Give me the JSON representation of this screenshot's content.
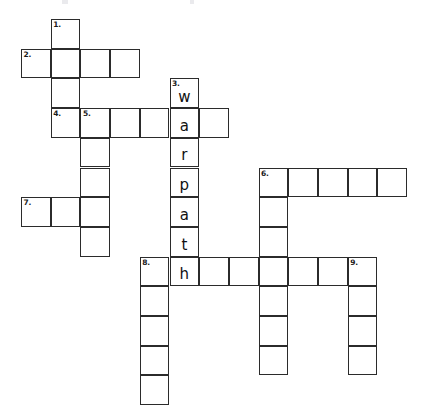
{
  "puzzle": {
    "title": "Crossword Puzzle",
    "grid": {
      "origin_x": 21,
      "origin_y": 19,
      "cell_size": 29.7,
      "columns": 13,
      "rows": 13,
      "line_color": "#2b2b2b",
      "cell_fill": "#ffffff",
      "background": "#ffffff"
    },
    "numbers": [
      {
        "label": "1.",
        "col": 1,
        "row": 0
      },
      {
        "label": "2.",
        "col": 0,
        "row": 1
      },
      {
        "label": "3.",
        "col": 5,
        "row": 2
      },
      {
        "label": "4.",
        "col": 1,
        "row": 3
      },
      {
        "label": "5.",
        "col": 2,
        "row": 3
      },
      {
        "label": "6.",
        "col": 8,
        "row": 5
      },
      {
        "label": "7.",
        "col": 0,
        "row": 6
      },
      {
        "label": "8.",
        "col": 4,
        "row": 8
      },
      {
        "label": "9.",
        "col": 11,
        "row": 8
      }
    ],
    "filled_answer": {
      "clue_number": "3.",
      "direction": "down",
      "word": "warpath",
      "start_col": 5,
      "start_row": 2,
      "letters": [
        "w",
        "a",
        "r",
        "p",
        "a",
        "t",
        "h"
      ]
    },
    "cells": [
      {
        "col": 1,
        "row": 0,
        "num": "1.",
        "letter": ""
      },
      {
        "col": 0,
        "row": 1,
        "num": "2.",
        "letter": ""
      },
      {
        "col": 1,
        "row": 1,
        "num": "",
        "letter": ""
      },
      {
        "col": 2,
        "row": 1,
        "num": "",
        "letter": ""
      },
      {
        "col": 3,
        "row": 1,
        "num": "",
        "letter": ""
      },
      {
        "col": 1,
        "row": 2,
        "num": "",
        "letter": ""
      },
      {
        "col": 5,
        "row": 2,
        "num": "3.",
        "letter": "w"
      },
      {
        "col": 1,
        "row": 3,
        "num": "4.",
        "letter": ""
      },
      {
        "col": 2,
        "row": 3,
        "num": "5.",
        "letter": ""
      },
      {
        "col": 3,
        "row": 3,
        "num": "",
        "letter": ""
      },
      {
        "col": 4,
        "row": 3,
        "num": "",
        "letter": ""
      },
      {
        "col": 5,
        "row": 3,
        "num": "",
        "letter": "a"
      },
      {
        "col": 6,
        "row": 3,
        "num": "",
        "letter": ""
      },
      {
        "col": 2,
        "row": 4,
        "num": "",
        "letter": ""
      },
      {
        "col": 5,
        "row": 4,
        "num": "",
        "letter": "r"
      },
      {
        "col": 2,
        "row": 5,
        "num": "",
        "letter": ""
      },
      {
        "col": 5,
        "row": 5,
        "num": "",
        "letter": "p"
      },
      {
        "col": 8,
        "row": 5,
        "num": "6.",
        "letter": ""
      },
      {
        "col": 9,
        "row": 5,
        "num": "",
        "letter": ""
      },
      {
        "col": 10,
        "row": 5,
        "num": "",
        "letter": ""
      },
      {
        "col": 11,
        "row": 5,
        "num": "",
        "letter": ""
      },
      {
        "col": 12,
        "row": 5,
        "num": "",
        "letter": ""
      },
      {
        "col": 0,
        "row": 6,
        "num": "7.",
        "letter": ""
      },
      {
        "col": 1,
        "row": 6,
        "num": "",
        "letter": ""
      },
      {
        "col": 2,
        "row": 6,
        "num": "",
        "letter": ""
      },
      {
        "col": 5,
        "row": 6,
        "num": "",
        "letter": "a"
      },
      {
        "col": 8,
        "row": 6,
        "num": "",
        "letter": ""
      },
      {
        "col": 2,
        "row": 7,
        "num": "",
        "letter": ""
      },
      {
        "col": 5,
        "row": 7,
        "num": "",
        "letter": "t"
      },
      {
        "col": 8,
        "row": 7,
        "num": "",
        "letter": ""
      },
      {
        "col": 4,
        "row": 8,
        "num": "8.",
        "letter": ""
      },
      {
        "col": 5,
        "row": 8,
        "num": "",
        "letter": "h"
      },
      {
        "col": 6,
        "row": 8,
        "num": "",
        "letter": ""
      },
      {
        "col": 7,
        "row": 8,
        "num": "",
        "letter": ""
      },
      {
        "col": 8,
        "row": 8,
        "num": "",
        "letter": ""
      },
      {
        "col": 9,
        "row": 8,
        "num": "",
        "letter": ""
      },
      {
        "col": 10,
        "row": 8,
        "num": "",
        "letter": ""
      },
      {
        "col": 11,
        "row": 8,
        "num": "9.",
        "letter": ""
      },
      {
        "col": 4,
        "row": 9,
        "num": "",
        "letter": ""
      },
      {
        "col": 8,
        "row": 9,
        "num": "",
        "letter": ""
      },
      {
        "col": 11,
        "row": 9,
        "num": "",
        "letter": ""
      },
      {
        "col": 4,
        "row": 10,
        "num": "",
        "letter": ""
      },
      {
        "col": 8,
        "row": 10,
        "num": "",
        "letter": ""
      },
      {
        "col": 11,
        "row": 10,
        "num": "",
        "letter": ""
      },
      {
        "col": 4,
        "row": 11,
        "num": "",
        "letter": ""
      },
      {
        "col": 8,
        "row": 11,
        "num": "",
        "letter": ""
      },
      {
        "col": 11,
        "row": 11,
        "num": "",
        "letter": ""
      },
      {
        "col": 4,
        "row": 12,
        "num": "",
        "letter": ""
      }
    ]
  }
}
